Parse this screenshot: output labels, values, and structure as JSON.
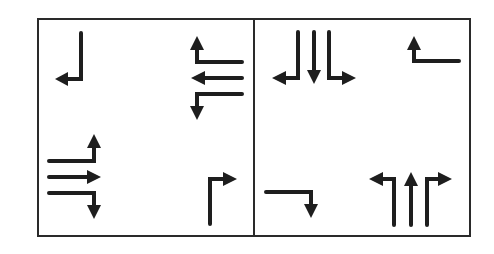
{
  "diagram": {
    "type": "intersection-lane-arrows",
    "colors": {
      "stroke": "#1e1e1e",
      "frame": "#2a2a2a",
      "background": "#ffffff"
    },
    "panels": [
      {
        "id": "left-panel",
        "groups": [
          {
            "position": "top-left",
            "approach": "southbound",
            "movements": [
              "right-turn"
            ]
          },
          {
            "position": "top-right",
            "approach": "westbound",
            "movements": [
              "right-turn",
              "through",
              "left-turn"
            ]
          },
          {
            "position": "bottom-left",
            "approach": "eastbound",
            "movements": [
              "left-turn",
              "through",
              "right-turn"
            ]
          },
          {
            "position": "bottom-right",
            "approach": "northbound",
            "movements": [
              "right-turn"
            ]
          }
        ]
      },
      {
        "id": "right-panel",
        "groups": [
          {
            "position": "top-left",
            "approach": "southbound",
            "movements": [
              "right-turn",
              "through",
              "left-turn"
            ]
          },
          {
            "position": "top-right",
            "approach": "westbound",
            "movements": [
              "right-turn"
            ]
          },
          {
            "position": "bottom-left",
            "approach": "eastbound",
            "movements": [
              "right-turn"
            ]
          },
          {
            "position": "bottom-right",
            "approach": "northbound",
            "movements": [
              "left-turn",
              "through",
              "right-turn"
            ]
          }
        ]
      }
    ]
  }
}
